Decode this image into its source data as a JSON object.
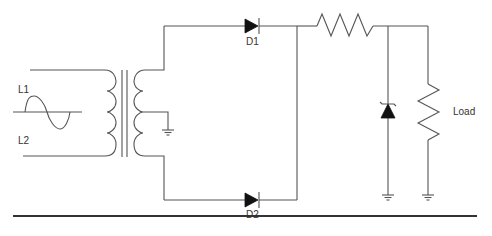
{
  "diagram": {
    "type": "circuit-schematic",
    "labels": {
      "input_top": "L1",
      "input_bottom": "L2",
      "diode_top": "D1",
      "diode_bottom": "D2",
      "load": "Load"
    },
    "components": [
      {
        "id": "ac-source",
        "kind": "sine-wave-source",
        "terminals": [
          "L1",
          "L2"
        ]
      },
      {
        "id": "transformer",
        "kind": "center-tapped-transformer",
        "center_tap": "ground"
      },
      {
        "id": "D1",
        "kind": "diode"
      },
      {
        "id": "D2",
        "kind": "diode"
      },
      {
        "id": "series-resistor",
        "kind": "resistor"
      },
      {
        "id": "zener",
        "kind": "zener-diode",
        "to": "ground"
      },
      {
        "id": "load",
        "kind": "resistor",
        "label": "Load",
        "to": "ground"
      }
    ],
    "colors": {
      "wire": "#555555",
      "fill": "#111111",
      "text": "#333333",
      "background": "#ffffff"
    }
  }
}
